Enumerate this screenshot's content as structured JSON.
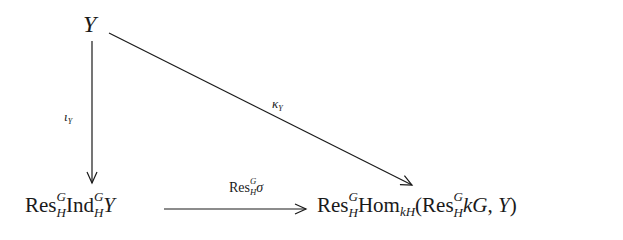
{
  "diagram": {
    "type": "commutative-diagram",
    "nodes": {
      "top": {
        "text": "Y"
      },
      "bottom_left": {
        "res": "Res",
        "res_sup": "G",
        "res_sub": "H",
        "ind": "Ind",
        "ind_sup": "G",
        "ind_sub": "H",
        "obj": "Y",
        "full": "Res^G_H Ind^G_H Y"
      },
      "bottom_right": {
        "res": "Res",
        "res_sup": "G",
        "res_sub": "H",
        "hom": "Hom",
        "hom_sub": "kH",
        "open": "(",
        "inner_res": "Res",
        "inner_res_sup": "G",
        "inner_res_sub": "H",
        "inner_obj": "kG",
        "comma": ",",
        "obj": "Y",
        "close": ")",
        "full": "Res^G_H Hom_kH(Res^G_H kG, Y)"
      }
    },
    "arrows": {
      "vertical": {
        "from": "Y",
        "to": "Res^G_H Ind^G_H Y",
        "label_main": "ι",
        "label_sub": "Y"
      },
      "diagonal": {
        "from": "Y",
        "to": "Res^G_H Hom_kH(Res^G_H kG, Y)",
        "label_main": "κ",
        "label_sub": "Y"
      },
      "horizontal": {
        "from": "Res^G_H Ind^G_H Y",
        "to": "Res^G_H Hom_kH(Res^G_H kG, Y)",
        "label_res": "Res",
        "label_sup": "G",
        "label_sub": "H",
        "label_map": "σ"
      }
    },
    "colors": {
      "ink": "#1a1a1a",
      "background": "#ffffff"
    }
  }
}
